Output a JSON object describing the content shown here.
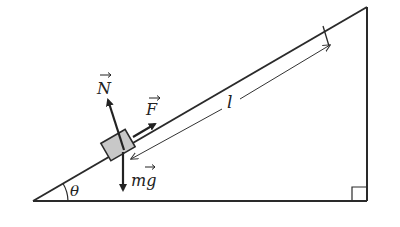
{
  "diagram": {
    "labels": {
      "normal_force": "N",
      "applied_force": "F",
      "weight": "mg",
      "length": "l",
      "angle": "θ"
    },
    "colors": {
      "line": "#2a2a2a",
      "block_fill": "#c8c8c8",
      "background": "#ffffff"
    }
  }
}
